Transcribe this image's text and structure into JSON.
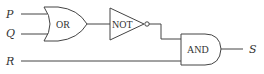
{
  "diagram": {
    "type": "logic-circuit",
    "inputs": [
      {
        "id": "P",
        "label": "P"
      },
      {
        "id": "Q",
        "label": "Q"
      },
      {
        "id": "R",
        "label": "R"
      }
    ],
    "gates": [
      {
        "id": "or",
        "type": "OR",
        "label": "OR",
        "inputs": [
          "P",
          "Q"
        ]
      },
      {
        "id": "not",
        "type": "NOT",
        "label": "NOT",
        "inputs": [
          "or"
        ]
      },
      {
        "id": "and",
        "type": "AND",
        "label": "AND",
        "inputs": [
          "not",
          "R"
        ]
      }
    ],
    "output": {
      "id": "S",
      "label": "S",
      "from": "and"
    },
    "colors": {
      "stroke": "#444444",
      "text": "#333333",
      "background": "#ffffff"
    }
  }
}
